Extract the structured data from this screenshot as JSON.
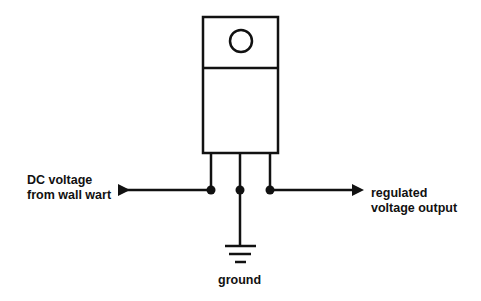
{
  "diagram": {
    "title": "",
    "component": {
      "type": "voltage-regulator",
      "package": "TO-220",
      "pins": [
        "input",
        "ground",
        "output"
      ]
    },
    "labels": {
      "input_line1": "DC voltage",
      "input_line2": "from wall wart",
      "output_line1": "regulated",
      "output_line2": "voltage output",
      "ground": "ground"
    },
    "colors": {
      "stroke": "#111111",
      "background": "#ffffff"
    }
  }
}
